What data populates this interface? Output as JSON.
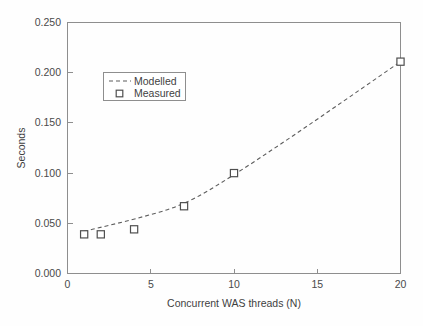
{
  "chart_data": {
    "type": "line",
    "title": "",
    "xlabel": "Concurrent WAS threads (N)",
    "ylabel": "Seconds",
    "xlim": [
      0,
      20
    ],
    "ylim": [
      0.0,
      0.25
    ],
    "grid": false,
    "legend_position": "upper-left-inside",
    "x_ticks": [
      "0",
      "5",
      "10",
      "15",
      "20"
    ],
    "x_tick_values": [
      0,
      5,
      10,
      15,
      20
    ],
    "y_ticks": [
      "0.000",
      "0.050",
      "0.100",
      "0.150",
      "0.200",
      "0.250"
    ],
    "y_tick_values": [
      0.0,
      0.05,
      0.1,
      0.15,
      0.2,
      0.25
    ],
    "series": [
      {
        "name": "Modelled",
        "style": "dashed-line",
        "x": [
          1,
          2,
          4,
          7,
          10,
          13,
          16,
          20
        ],
        "values": [
          0.042,
          0.046,
          0.054,
          0.068,
          0.098,
          0.131,
          0.165,
          0.211
        ]
      },
      {
        "name": "Measured",
        "style": "open-square-marker",
        "x": [
          1,
          2,
          4,
          7,
          10,
          20
        ],
        "values": [
          0.039,
          0.039,
          0.044,
          0.067,
          0.1,
          0.211
        ]
      }
    ]
  },
  "legend": {
    "entries": [
      {
        "label": "Modelled",
        "marker": "dashed-line-swatch"
      },
      {
        "label": "Measured",
        "marker": "open-square-swatch"
      }
    ]
  },
  "colors": {
    "line": "#5d5d5d",
    "marker_stroke": "#4f4f4f",
    "marker_fill": "#ffffff",
    "axis": "#8e8e8e",
    "text": "#3f3f3f",
    "background": "#fefefe"
  }
}
